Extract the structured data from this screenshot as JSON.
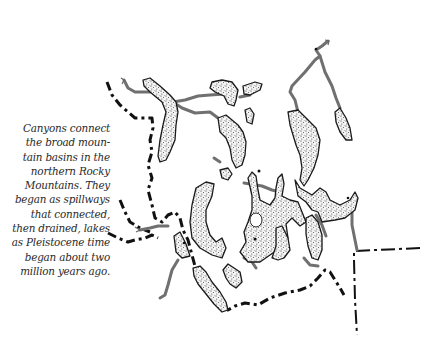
{
  "figure": {
    "type": "hand-drawn map illustration",
    "region": "northern Rocky Mountains",
    "caption_lines": [
      "Canyons connect",
      "the broad moun-",
      "tain basins in the",
      "northern Rocky",
      "Mountains. They",
      "began as spillways",
      "that connected,",
      "then drained, lakes",
      "as Pleistocene time",
      "began about two",
      "million years ago."
    ],
    "legend_implicit": {
      "stippled_shapes": "mountain basins (former lakes)",
      "gray_lines": "rivers / canyons",
      "heavy_dashed_line": "continental divide",
      "dash-dot_line": "state boundary"
    },
    "colors": {
      "river": "#707070",
      "basin_outline": "#1a1a1a",
      "boundary": "#111111",
      "background": "#ffffff"
    }
  }
}
